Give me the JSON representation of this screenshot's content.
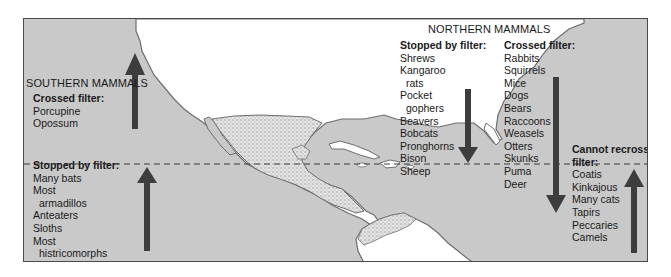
{
  "figure": {
    "southern": {
      "heading": "SOUTHERN MAMMALS",
      "crossed": {
        "title": "Crossed filter:",
        "items": [
          "Porcupine",
          "Opossum"
        ],
        "arrow_direction": "up"
      },
      "stopped": {
        "title": "Stopped by filter:",
        "items": [
          {
            "text": "Many bats",
            "indent": false
          },
          {
            "text": "Most",
            "indent": false
          },
          {
            "text": "armadillos",
            "indent": true
          },
          {
            "text": "Anteaters",
            "indent": false
          },
          {
            "text": "Sloths",
            "indent": false
          },
          {
            "text": "Most",
            "indent": false
          },
          {
            "text": "histricomorphs",
            "indent": true
          }
        ],
        "arrow_direction": "up"
      }
    },
    "northern": {
      "heading": "NORTHERN MAMMALS",
      "stopped": {
        "title": "Stopped by filter:",
        "items": [
          {
            "text": "Shrews",
            "indent": false
          },
          {
            "text": "Kangaroo",
            "indent": false
          },
          {
            "text": "rats",
            "indent": true
          },
          {
            "text": "Pocket",
            "indent": false
          },
          {
            "text": "gophers",
            "indent": true
          },
          {
            "text": "Beavers",
            "indent": false
          },
          {
            "text": "Bobcats",
            "indent": false
          },
          {
            "text": "Pronghorns",
            "indent": false
          },
          {
            "text": "Bison",
            "indent": false
          },
          {
            "text": "Sheep",
            "indent": false
          }
        ],
        "arrow_direction": "down"
      },
      "crossed": {
        "title": "Crossed filter:",
        "items": [
          "Rabbits",
          "Squirrels",
          "Mice",
          "Dogs",
          "Bears",
          "Raccoons",
          "Weasels",
          "Otters",
          "Skunks",
          "Puma",
          "Deer"
        ],
        "arrow_direction": "down"
      },
      "cannot_recross": {
        "title_line1": "Cannot recross",
        "title_line2": "filter:",
        "items": [
          "Coatis",
          "Kinkajous",
          "Many cats",
          "Tapirs",
          "Peccaries",
          "Camels"
        ],
        "arrow_direction": "up"
      }
    },
    "colors": {
      "ocean": "#c9c9c9",
      "land": "#ffffff",
      "stipple_land": "#bdbdbd",
      "arrow": "#3d3d3d",
      "coast": "#6e6e6e",
      "filter_line": "#3a3a3a"
    }
  }
}
